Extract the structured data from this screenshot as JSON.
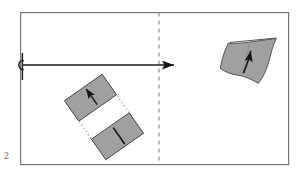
{
  "figure": {
    "page_number": "2",
    "caption": "",
    "colors": {
      "frame_stroke": "#787878",
      "surface_fill": "#a0a0a0",
      "surface_stroke": "#4a4a4a",
      "arrow_stroke": "#1a1a1a",
      "dashed_divider": "#8f8f8f",
      "dotted_outline": "#9a9a9a",
      "background": "#ffffff",
      "page_number_color": "#6d6d6d"
    },
    "frame": {
      "x": 20,
      "y": 12,
      "width": 269,
      "height": 153,
      "stroke_width": 1.2
    },
    "divider": {
      "name": "dashed-vertical-divider",
      "x": 159,
      "y1": 12,
      "y2": 165,
      "dash_pattern": "4 4",
      "stroke_width": 1.2
    },
    "transform_arrow": {
      "name": "horizontal-transform-arrow",
      "x_start": 22,
      "x_end": 176,
      "y": 65,
      "stroke_width": 1.6,
      "hook_cx": 19,
      "hook_cy": 65,
      "hook_r": 4.2,
      "tick_x": 22,
      "tick_y1": 53,
      "tick_y2": 80
    },
    "flat_sheet": {
      "name": "flat-rectangular-sheet",
      "label": "flat sheet",
      "rotation_deg": -35,
      "center_x": 104,
      "center_y": 117,
      "width": 46,
      "height": 72,
      "outline_style": "dotted",
      "blocks": [
        {
          "name": "flat-sheet-upper-block",
          "marker": "arrow-up",
          "fill": "#a0a0a0"
        },
        {
          "name": "flat-sheet-lower-block",
          "marker": "line-vertical",
          "fill": "#a0a0a0"
        }
      ]
    },
    "curved_sheet": {
      "name": "curved-bent-surface",
      "label": "bent surface",
      "center_x": 250,
      "center_y": 58,
      "marker": "arrow-up-curved",
      "fill": "#a0a0a0",
      "highlight_stroke": "#555555"
    }
  }
}
